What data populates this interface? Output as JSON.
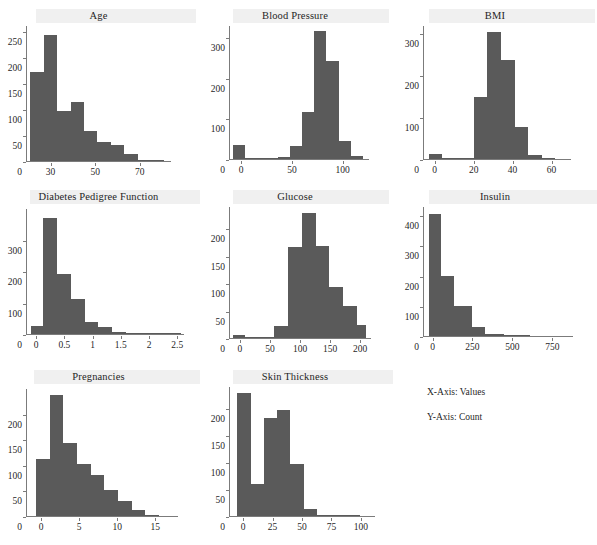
{
  "figure": {
    "legend": {
      "xaxis_note": "X-Axis: Values",
      "yaxis_note": "Y-Axis: Count"
    },
    "bar_color": "#5a5a5a",
    "background_color": "#ffffff",
    "axis_color": "#7b7b7b"
  },
  "chart_data": [
    {
      "type": "bar",
      "title": "Age",
      "xlabel": "",
      "ylabel": "",
      "xlim": [
        19,
        84
      ],
      "ylim": [
        0,
        262
      ],
      "xticks": [
        30,
        50,
        70
      ],
      "yticks": [
        0,
        50,
        100,
        150,
        200,
        250
      ],
      "grid": false,
      "bin_edges": [
        21,
        27,
        33,
        39,
        45,
        51,
        57,
        63,
        69,
        75,
        81
      ],
      "values": [
        172,
        243,
        97,
        113,
        57,
        36,
        30,
        14,
        1,
        0
      ]
    },
    {
      "type": "bar",
      "title": "Blood Pressure",
      "xlabel": "",
      "ylabel": "",
      "xlim": [
        -12,
        126
      ],
      "ylim": [
        0,
        330
      ],
      "xticks": [
        0,
        50,
        100
      ],
      "yticks": [
        0,
        100,
        200,
        300
      ],
      "grid": false,
      "bin_edges": [
        -8,
        4,
        24,
        36,
        48,
        60,
        72,
        84,
        96,
        108,
        120
      ],
      "values": [
        35,
        0,
        3,
        6,
        33,
        116,
        316,
        241,
        44,
        7
      ],
      "zero_bar": {
        "x": -8,
        "width": 12,
        "value": 35
      }
    },
    {
      "type": "bar",
      "title": "BMI",
      "xlabel": "",
      "ylabel": "",
      "xlim": [
        -6,
        70
      ],
      "ylim": [
        0,
        320
      ],
      "xticks": [
        0,
        20,
        40,
        60
      ],
      "yticks": [
        0,
        100,
        200,
        300
      ],
      "grid": false,
      "bin_edges": [
        -3,
        4,
        13,
        20,
        27,
        34,
        41,
        48,
        55,
        62
      ],
      "values": [
        11,
        0,
        3,
        147,
        303,
        237,
        77,
        9,
        1
      ]
    },
    {
      "type": "bar",
      "title": "Diabetes Pedigree Function",
      "xlabel": "",
      "ylabel": "",
      "xlim": [
        -0.18,
        2.62
      ],
      "ylim": [
        0,
        400
      ],
      "xticks": [
        0.0,
        0.5,
        1.0,
        1.5,
        2.0,
        2.5
      ],
      "yticks": [
        0,
        100,
        200,
        300
      ],
      "grid": false,
      "bin_edges": [
        -0.1,
        0.13,
        0.37,
        0.62,
        0.86,
        1.1,
        1.35,
        1.59,
        1.84,
        2.08,
        2.32,
        2.56
      ],
      "values": [
        26,
        367,
        191,
        111,
        38,
        21,
        5,
        4,
        1,
        0,
        2
      ]
    },
    {
      "type": "bar",
      "title": "Glucose",
      "xlabel": "",
      "ylabel": "",
      "xlim": [
        -18,
        218
      ],
      "ylim": [
        0,
        240
      ],
      "xticks": [
        0,
        50,
        100,
        150,
        200
      ],
      "yticks": [
        0,
        50,
        100,
        150,
        200
      ],
      "grid": false,
      "bin_edges": [
        -12,
        8,
        34,
        57,
        80,
        103,
        126,
        149,
        172,
        195,
        210
      ],
      "values": [
        5,
        0,
        1,
        21,
        166,
        227,
        168,
        92,
        58,
        23
      ],
      "zero_bar": {
        "x": -12,
        "width": 20,
        "value": 5
      }
    },
    {
      "type": "bar",
      "title": "Insulin",
      "xlabel": "",
      "ylabel": "",
      "xlim": [
        -60,
        880
      ],
      "ylim": [
        0,
        430
      ],
      "xticks": [
        0,
        250,
        500,
        750
      ],
      "yticks": [
        0,
        100,
        200,
        300,
        400
      ],
      "grid": false,
      "bin_edges": [
        -25,
        55,
        135,
        250,
        330,
        450,
        610
      ],
      "values": [
        405,
        200,
        100,
        30,
        8,
        3
      ]
    },
    {
      "type": "bar",
      "title": "Pregnancies",
      "xlabel": "",
      "ylabel": "",
      "xlim": [
        -2,
        18
      ],
      "ylim": [
        0,
        250
      ],
      "xticks": [
        0,
        5,
        10,
        15
      ],
      "yticks": [
        0,
        50,
        100,
        150,
        200
      ],
      "grid": false,
      "bin_edges": [
        -0.7,
        1.1,
        2.9,
        4.7,
        6.5,
        8.3,
        10.1,
        11.9,
        13.7,
        15.5
      ],
      "values": [
        111,
        236,
        142,
        101,
        80,
        51,
        29,
        12,
        0
      ]
    },
    {
      "type": "bar",
      "title": "Skin Thickness",
      "xlabel": "",
      "ylabel": "",
      "xlim": [
        -12,
        112
      ],
      "ylim": [
        0,
        240
      ],
      "xticks": [
        0,
        25,
        50,
        75,
        100
      ],
      "yticks": [
        0,
        50,
        100,
        150,
        200
      ],
      "grid": false,
      "bin_edges": [
        -5,
        7,
        18,
        29,
        40,
        52,
        63,
        75,
        87,
        99
      ],
      "values": [
        227,
        60,
        181,
        196,
        96,
        13,
        1,
        0,
        1
      ]
    }
  ]
}
